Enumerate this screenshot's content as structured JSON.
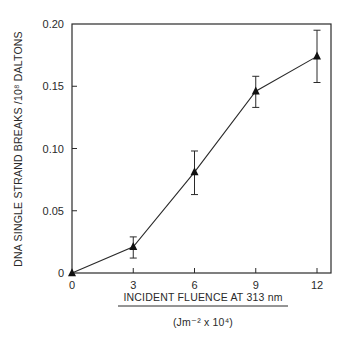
{
  "chart_data": {
    "type": "line",
    "title": "",
    "xlabel": "INCIDENT FLUENCE AT 313 nm",
    "xlabel_units": "(Jm⁻² x 10⁴)",
    "ylabel": "DNA SINGLE STRAND BREAKS /10⁸ DALTONS",
    "xlim": [
      0,
      12.4
    ],
    "ylim": [
      0,
      0.2
    ],
    "x_ticks": [
      0,
      3,
      6,
      9,
      12
    ],
    "x_tick_labels": [
      "0",
      "3",
      "6",
      "9",
      "12"
    ],
    "y_ticks": [
      0,
      0.05,
      0.1,
      0.15,
      0.2
    ],
    "y_tick_labels": [
      "0",
      "0.05",
      "0.10",
      "0.15",
      "0.20"
    ],
    "grid": false,
    "legend": null,
    "marker": "triangle",
    "series": [
      {
        "name": "DNA single strand breaks",
        "x": [
          0,
          3,
          6,
          9,
          12
        ],
        "y": [
          0.0,
          0.021,
          0.081,
          0.146,
          0.174
        ],
        "error_low": [
          0.0,
          0.012,
          0.063,
          0.133,
          0.153
        ],
        "error_high": [
          0.0,
          0.029,
          0.098,
          0.158,
          0.195
        ]
      }
    ]
  }
}
